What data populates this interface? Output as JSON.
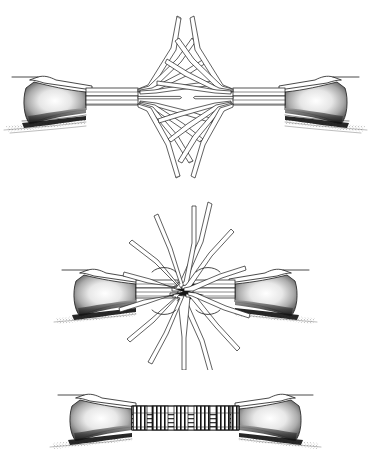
{
  "figure": {
    "background_color": "#ffffff",
    "ink_color": "#1c1c1c",
    "width_px": 371,
    "height_px": 458,
    "panel_count": 3
  },
  "panels": [
    {
      "id": "panel-top",
      "index": 1,
      "name": "unlaid-rope-ends",
      "caption": "",
      "y_offset": 0,
      "height": 190,
      "stage_label": "Stage 1 — rope ends unlaid, strands fanned out",
      "left_rope": {
        "name": "left-rope-end",
        "served_end": true,
        "strand_count": 9,
        "core_strand_count": 4
      },
      "right_rope": {
        "name": "right-rope-end",
        "served_end": true,
        "strand_count": 9,
        "core_strand_count": 4
      }
    },
    {
      "id": "panel-middle",
      "index": 2,
      "name": "strands-interlaced",
      "caption": "",
      "y_offset": 190,
      "height": 180,
      "stage_label": "Stage 2 — rope ends butted, strands crossed and interlaced",
      "left_rope": {
        "name": "left-rope-end",
        "served_end": true,
        "strand_count": 9
      },
      "right_rope": {
        "name": "right-rope-end",
        "served_end": true,
        "strand_count": 9
      }
    },
    {
      "id": "panel-bottom",
      "index": 3,
      "name": "finished-served-splice",
      "caption": "",
      "y_offset": 370,
      "height": 88,
      "stage_label": "Stage 3 — completed splice with serving bands",
      "serving": {
        "name": "serving-bands",
        "band_count": 6,
        "tucked_sections": 5
      }
    }
  ],
  "colors": {
    "background": "#ffffff",
    "ink": "#1c1c1c",
    "shade": "#6d6d6d",
    "deep_shade": "#111111"
  }
}
